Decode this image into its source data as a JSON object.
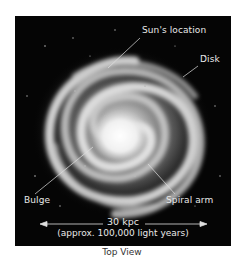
{
  "figure": {
    "labels": {
      "sun": "Sun's location",
      "disk": "Disk",
      "bulge": "Bulge",
      "arm": "Spiral arm"
    },
    "scale": {
      "value": "30 kpc",
      "note": "(approx. 100,000 light years)"
    },
    "caption": "Top View",
    "colors": {
      "background": "#050505",
      "galaxy": "#d9d9d9",
      "text": "#e8e8e8"
    }
  }
}
